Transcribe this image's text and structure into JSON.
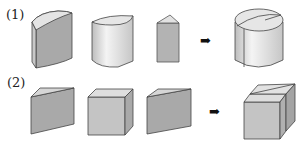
{
  "rows": [
    {
      "label": "(1)",
      "pieces": [
        "quarter-cylinder-wedge",
        "half-cylinder",
        "thin-cylinder-wedge"
      ],
      "result": "cylinder"
    },
    {
      "label": "(2)",
      "pieces": [
        "triangular-prism-left",
        "cube",
        "triangular-prism-right"
      ],
      "result": "cube"
    }
  ],
  "arrow": "➡",
  "colors": {
    "dark_face": "#a9a9a9",
    "light_face": "#d8d8d8",
    "top_face": "#e6e6e6",
    "edge": "#444444"
  }
}
